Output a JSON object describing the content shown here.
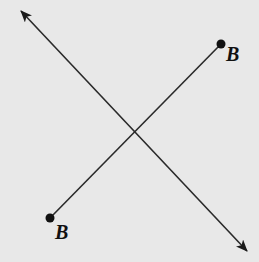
{
  "diagram": {
    "background": "#e8e8e8",
    "stroke": "#2a2a2a",
    "line": {
      "name": "line",
      "start": [
        21,
        11
      ],
      "end": [
        247,
        251
      ],
      "arrowheads": "both"
    },
    "segment": {
      "name": "segment",
      "start": [
        221,
        44
      ],
      "end": [
        50,
        218
      ],
      "endpoints": [
        {
          "point": [
            221,
            44
          ],
          "label": "B",
          "label_pos": [
            226,
            61
          ]
        },
        {
          "point": [
            50,
            218
          ],
          "label": "B",
          "label_pos": [
            55,
            239
          ]
        }
      ]
    },
    "labels": {
      "top_point": "B",
      "bottom_point": "B"
    }
  }
}
